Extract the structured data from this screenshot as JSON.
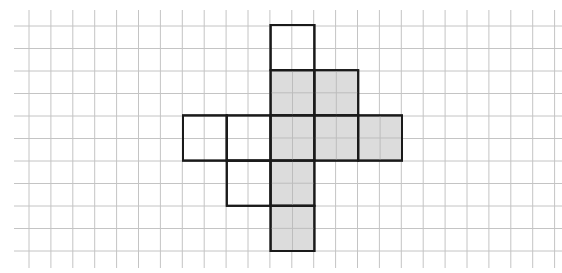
{
  "diagram": {
    "type": "grid-net",
    "colors": {
      "background": "#ffffff",
      "grid_line": "#c4c4c4",
      "outline": "#1a1a1a",
      "shaded_fill": "#dcdcdc",
      "unshaded_fill": "#ffffff"
    },
    "grid": {
      "x_start": 29,
      "x_step": 21.9,
      "x_count": 25,
      "y_start": 26,
      "y_step": 22.5,
      "y_count": 11,
      "extent": {
        "x0": 14,
        "x1": 562,
        "y0": 10,
        "y1": 268
      }
    },
    "shape": {
      "origin_x": 183,
      "origin_y": 25,
      "cell_w": 43.8,
      "cell_h": 45.2,
      "cells": [
        {
          "col": 2,
          "row": 0,
          "shaded": false
        },
        {
          "col": 2,
          "row": 1,
          "shaded": true
        },
        {
          "col": 3,
          "row": 1,
          "shaded": true
        },
        {
          "col": 0,
          "row": 2,
          "shaded": false
        },
        {
          "col": 1,
          "row": 2,
          "shaded": false
        },
        {
          "col": 2,
          "row": 2,
          "shaded": true
        },
        {
          "col": 3,
          "row": 2,
          "shaded": true
        },
        {
          "col": 4,
          "row": 2,
          "shaded": true
        },
        {
          "col": 1,
          "row": 3,
          "shaded": false
        },
        {
          "col": 2,
          "row": 3,
          "shaded": true
        },
        {
          "col": 2,
          "row": 4,
          "shaded": true
        }
      ]
    }
  }
}
